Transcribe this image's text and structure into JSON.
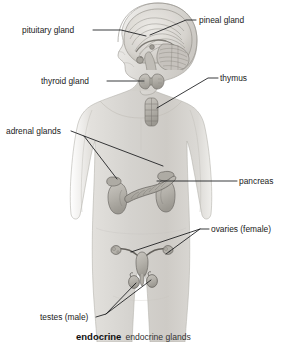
{
  "figure": {
    "background_color": "#ffffff",
    "line_color": "#16181a",
    "body_fill": "#d8d6d2",
    "organ_fill": "#b7b4ae"
  },
  "labels": [
    {
      "id": "pituitary-gland",
      "text": "pituitary gland",
      "text_x": 22,
      "text_y": 33,
      "anchor": "start",
      "leaders": [
        "M93,30 L121,30 L146,36"
      ]
    },
    {
      "id": "pineal-gland",
      "text": "pineal gland",
      "text_x": 199,
      "text_y": 23,
      "anchor": "start",
      "leaders": [
        "M196,20 L186,20 L150,35"
      ]
    },
    {
      "id": "thyroid-gland",
      "text": "thyroid gland",
      "text_x": 41,
      "text_y": 84,
      "anchor": "start",
      "leaders": [
        "M107,81 L144,81"
      ]
    },
    {
      "id": "thymus",
      "text": "thymus",
      "text_x": 220,
      "text_y": 81,
      "anchor": "start",
      "leaders": [
        "M218,78 L208,78 L157,108"
      ]
    },
    {
      "id": "adrenal-glands",
      "text": "adrenal glands",
      "text_x": 6,
      "text_y": 134,
      "anchor": "start",
      "leaders": [
        "M71,131 L84,136 L117,179",
        "M84,136 L163,166"
      ]
    },
    {
      "id": "pancreas",
      "text": "pancreas",
      "text_x": 239,
      "text_y": 184,
      "anchor": "start",
      "leaders": [
        "M237,181 L228,181 L157,181"
      ]
    },
    {
      "id": "ovaries-female",
      "text": "ovaries (female)",
      "text_x": 211,
      "text_y": 232,
      "anchor": "start",
      "leaders": [
        "M209,229 L200,229 L131,252",
        "M200,229 L166,254"
      ]
    },
    {
      "id": "testes-male",
      "text": "testes (male)",
      "text_x": 40,
      "text_y": 320,
      "anchor": "start",
      "leaders": [
        "M96,317 L106,314 L136,283",
        "M106,314 L151,280"
      ]
    }
  ],
  "caption": {
    "strong": "endocrine",
    "plain": "endocrine glands",
    "x": 76,
    "y": 340
  }
}
